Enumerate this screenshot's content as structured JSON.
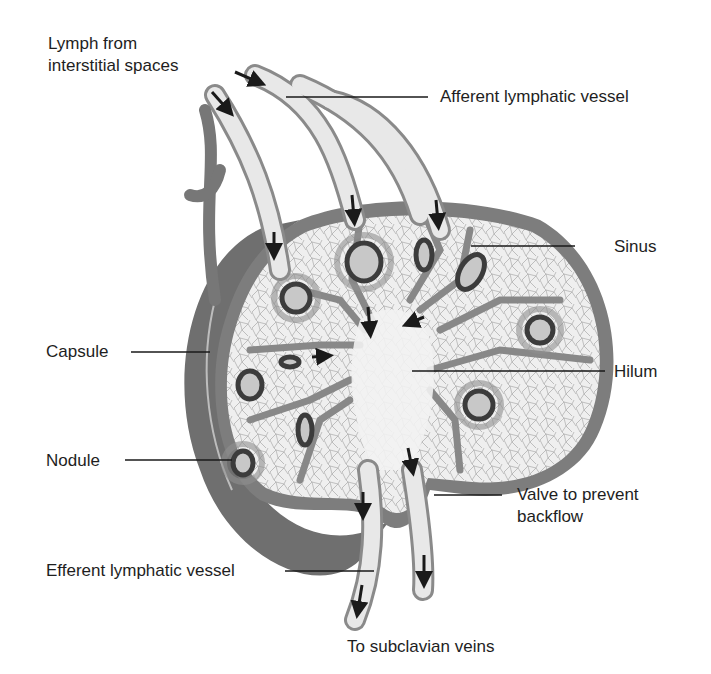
{
  "diagram": {
    "labels": {
      "lymph_from": "Lymph from\ninterstitial spaces",
      "afferent": "Afferent lymphatic vessel",
      "sinus": "Sinus",
      "capsule": "Capsule",
      "hilum": "Hilum",
      "nodule": "Nodule",
      "valve": "Valve to prevent\nbackflow",
      "efferent": "Efferent lymphatic vessel",
      "subclavian": "To subclavian veins"
    },
    "colors": {
      "background": "#ffffff",
      "capsule": "#7d7d7d",
      "capsule_dark": "#5e5e5e",
      "vessel_fill": "#e6e6e6",
      "vessel_wall": "#8a8a8a",
      "tissue": "#eeeeee",
      "nodule_ring": "#3c3c3c",
      "arrow": "#1a1a1a",
      "leader_line": "#1a1a1a"
    }
  }
}
